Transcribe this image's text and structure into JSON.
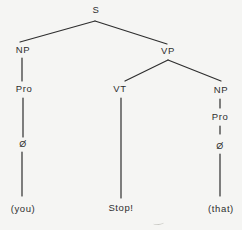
{
  "diagram": {
    "type": "syntax-tree",
    "nodes": {
      "s": {
        "label": "S"
      },
      "np_left": {
        "label": "NP"
      },
      "vp": {
        "label": "VP"
      },
      "pro_left": {
        "label": "Pro"
      },
      "vt": {
        "label": "VT"
      },
      "np_right": {
        "label": "NP"
      },
      "pro_right": {
        "label": "Pro"
      },
      "null_left": {
        "label": "Ø"
      },
      "null_right": {
        "label": "Ø"
      },
      "word_left": {
        "label": "(you)"
      },
      "word_mid": {
        "label": "Stop!"
      },
      "word_right": {
        "label": "(that)"
      }
    },
    "structure": [
      "S -> NP VP",
      "NP(left) -> Pro -> Ø -> (you)",
      "VP -> VT NP",
      "VT -> Stop!",
      "NP(right) -> Pro -> Ø -> (that)"
    ],
    "colors": {
      "ink": "#2e2e2e",
      "paper": "#f5f5f3"
    }
  }
}
